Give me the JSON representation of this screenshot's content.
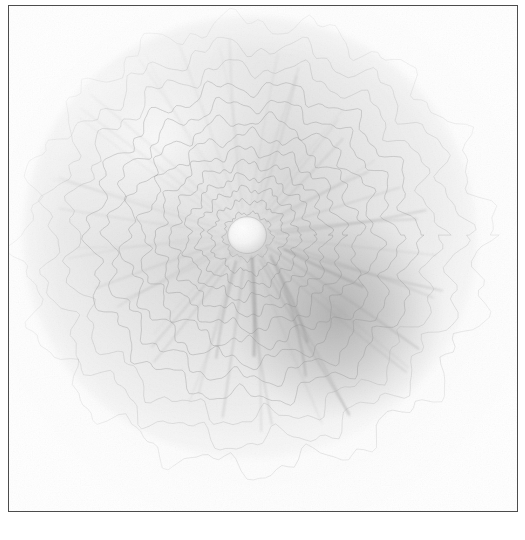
{
  "figure": {
    "kind": "contour-map",
    "caption_visible": false,
    "frame": {
      "visible": true,
      "line_color": "#4c4c4c",
      "line_width_px": 1.6,
      "x": 8,
      "y": 5,
      "width": 510,
      "height": 507
    },
    "margin_ghost_text": {
      "left": "",
      "right": ""
    },
    "colors": {
      "page_background": "#ffffff",
      "plate_background": "#fdfdfd",
      "contour_line": "#8f8f8f",
      "contour_line_outer": "#a8a8a8",
      "shadow_dark": "#8a8a8a",
      "summit_highlight": "#fbfbfb",
      "frame": "#4c4c4c"
    }
  },
  "chart_data": {
    "type": "heatmap",
    "title": "",
    "subtitle": "",
    "xlabel": "",
    "ylabel": "",
    "grid": false,
    "legend": null,
    "annotations": [],
    "xlim": [
      0,
      510
    ],
    "ylim": [
      0,
      507
    ],
    "tick_labels": {
      "x": [],
      "y": []
    },
    "summit": {
      "cx": 239,
      "cy": 230,
      "radius": 19,
      "label": ""
    },
    "light_source": {
      "azimuth_deg": 315,
      "elevation_deg": 45
    },
    "contours": [
      {
        "index": 0,
        "radius": 24,
        "lobes": 9,
        "amplitude": 2.0,
        "phase": 0.2,
        "opacity": 0.52
      },
      {
        "index": 1,
        "radius": 37,
        "lobes": 10,
        "amplitude": 3.0,
        "phase": 0.65,
        "opacity": 0.52
      },
      {
        "index": 2,
        "radius": 50,
        "lobes": 11,
        "amplitude": 3.6,
        "phase": 1.1,
        "opacity": 0.5
      },
      {
        "index": 3,
        "radius": 63,
        "lobes": 11,
        "amplitude": 4.2,
        "phase": 1.55,
        "opacity": 0.5
      },
      {
        "index": 4,
        "radius": 77,
        "lobes": 12,
        "amplitude": 4.8,
        "phase": 2.0,
        "opacity": 0.48
      },
      {
        "index": 5,
        "radius": 92,
        "lobes": 12,
        "amplitude": 5.4,
        "phase": 2.45,
        "opacity": 0.48
      },
      {
        "index": 6,
        "radius": 108,
        "lobes": 13,
        "amplitude": 6.0,
        "phase": 2.9,
        "opacity": 0.46
      },
      {
        "index": 7,
        "radius": 125,
        "lobes": 13,
        "amplitude": 6.6,
        "phase": 0.35,
        "opacity": 0.46
      },
      {
        "index": 8,
        "radius": 143,
        "lobes": 14,
        "amplitude": 7.2,
        "phase": 0.8,
        "opacity": 0.44
      },
      {
        "index": 9,
        "radius": 162,
        "lobes": 14,
        "amplitude": 8.0,
        "phase": 1.25,
        "opacity": 0.42
      },
      {
        "index": 10,
        "radius": 183,
        "lobes": 15,
        "amplitude": 9.0,
        "phase": 1.7,
        "opacity": 0.4
      },
      {
        "index": 11,
        "radius": 206,
        "lobes": 15,
        "amplitude": 10.0,
        "phase": 2.15,
        "opacity": 0.36
      },
      {
        "index": 12,
        "radius": 232,
        "lobes": 16,
        "amplitude": 11.0,
        "phase": 2.6,
        "opacity": 0.32
      }
    ],
    "radial_rays": {
      "count": 44,
      "inner_radius": 22,
      "outer_radius": 215,
      "opacity": 0.2
    },
    "shading": {
      "highlight_center": {
        "x": 200,
        "y": 190
      },
      "shadow_center": {
        "x": 300,
        "y": 290
      },
      "shadow_peak_gray": "#8a8a8a",
      "ambient_gray": "#f2f2f2"
    }
  }
}
